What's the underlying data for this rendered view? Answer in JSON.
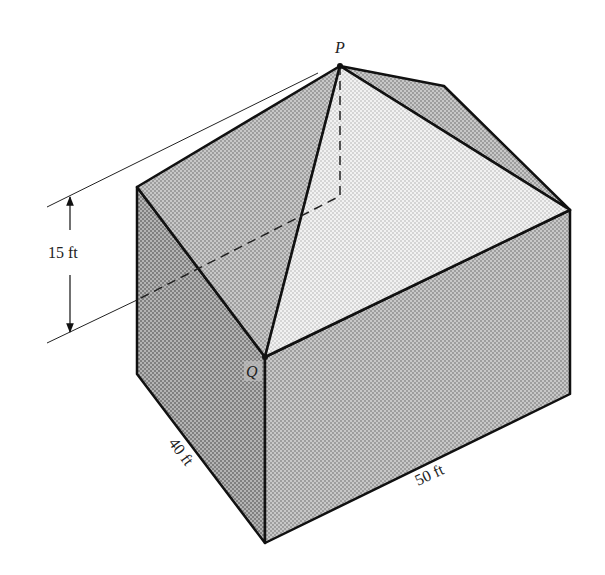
{
  "figure": {
    "points": {
      "apex_label": "P",
      "corner_label": "Q"
    },
    "dimensions": {
      "height_label": "15 ft",
      "depth_label": "40 ft",
      "width_label": "50 ft"
    },
    "colors": {
      "wall_left": "#9a9a9a",
      "wall_right": "#b5b5b5",
      "roof_left": "#a8a8a8",
      "roof_front": "#e4e4e4",
      "roof_right": "#b0b0b0",
      "edge": "#111111"
    }
  }
}
